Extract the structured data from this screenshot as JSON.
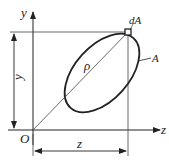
{
  "diagram": {
    "axes": {
      "y_label": "y",
      "z_label": "z",
      "origin_label": "O"
    },
    "labels": {
      "area_element": "dA",
      "area": "A",
      "radius": "ρ",
      "dim_y": "y",
      "dim_z": "z"
    },
    "colors": {
      "stroke": "#222222",
      "background": "#ffffff"
    }
  }
}
